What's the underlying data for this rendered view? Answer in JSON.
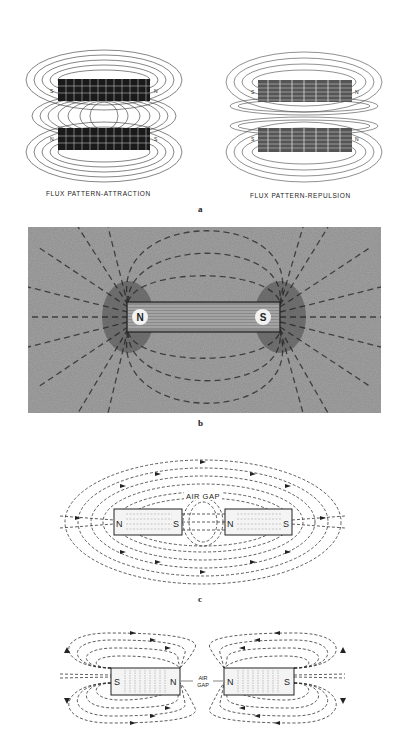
{
  "figure_a": {
    "left_caption": "FLUX PATTERN-ATTRACTION",
    "right_caption": "FLUX PATTERN-REPULSION",
    "sublabel": "a",
    "left_poles": {
      "top_left": "S",
      "top_right": "N",
      "bottom_left": "N",
      "bottom_right": "S"
    },
    "right_poles": {
      "top_left": "S",
      "top_right": "N",
      "bottom_left": "S",
      "bottom_right": "N"
    }
  },
  "figure_b": {
    "sublabel": "b",
    "pole_left": "N",
    "pole_right": "S"
  },
  "figure_c": {
    "sublabel": "c",
    "air_gap_label": "AIR GAP",
    "magnet_left": {
      "left": "N",
      "right": "S"
    },
    "magnet_right": {
      "left": "N",
      "right": "S"
    }
  },
  "figure_d": {
    "air_gap_line1": "AIR",
    "air_gap_line2": "GAP",
    "magnet_left": {
      "left": "S",
      "right": "N"
    },
    "magnet_right": {
      "left": "N",
      "right": "S"
    }
  },
  "colors": {
    "ink": "#222222",
    "photo_bg": "#8a8a8a",
    "paper": "#ffffff"
  }
}
